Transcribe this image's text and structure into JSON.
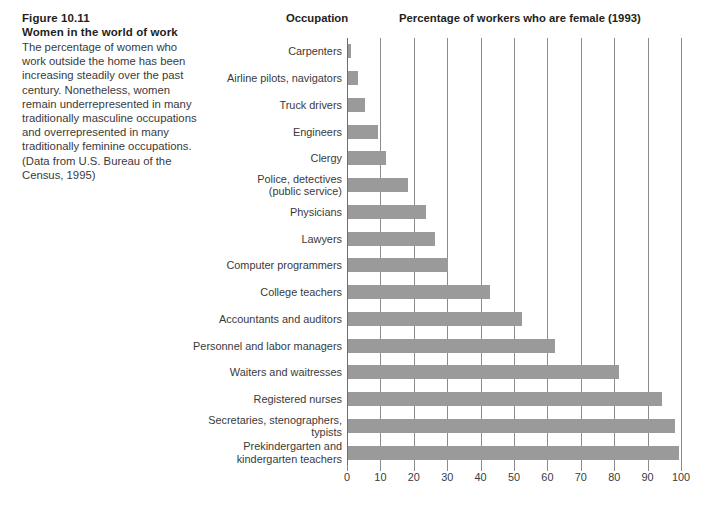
{
  "caption": {
    "figure_number": "Figure 10.11",
    "figure_title": "Women in the world of work",
    "body": "The percentage of women who work outside the home has been increasing steadily over the past century. Nonetheless, women remain underrepresented in many traditionally masculine occupations and overrepresented in many traditionally feminine occupations. (Data from U.S. Bureau of the Census, 1995)"
  },
  "headers": {
    "occupation": "Occupation",
    "percentage": "Percentage of workers who are female (1993)"
  },
  "colors": {
    "bar": "#9a9a9a",
    "gridline": "#8c8c8e",
    "text": "#3a3a3c",
    "heading": "#231f20",
    "background": "#ffffff"
  },
  "chart_data": {
    "type": "bar",
    "orientation": "horizontal",
    "title": "Percentage of workers who are female (1993)",
    "xlabel": "Percentage of workers who are female (1993)",
    "ylabel": "Occupation",
    "xlim": [
      0,
      100
    ],
    "xticks": [
      0,
      10,
      20,
      30,
      40,
      50,
      60,
      70,
      80,
      90,
      100
    ],
    "grid": "vertical",
    "legend": "none",
    "categories": [
      "Carpenters",
      "Airline pilots, navigators",
      "Truck drivers",
      "Engineers",
      "Clergy",
      "Police, detectives\n(public service)",
      "Physicians",
      "Lawyers",
      "Computer programmers",
      "College teachers",
      "Accountants and auditors",
      "Personnel and labor managers",
      "Waiters and waitresses",
      "Registered nurses",
      "Secretaries, stenographers,\ntypists",
      "Prekindergarten and\nkindergarten teachers"
    ],
    "values": [
      1,
      3,
      5,
      9,
      11.5,
      18,
      23.5,
      26,
      30,
      42.5,
      52,
      62,
      81,
      94,
      98,
      99
    ]
  }
}
